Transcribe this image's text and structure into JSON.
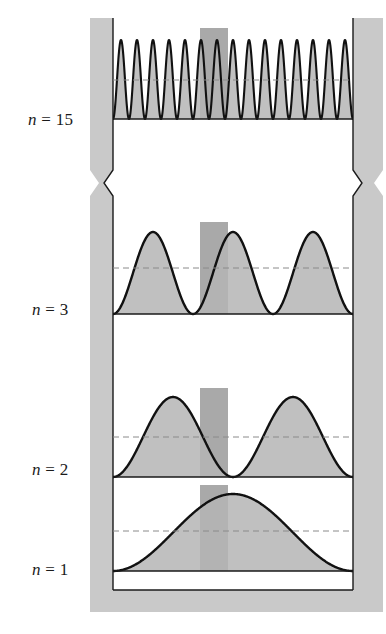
{
  "figure": {
    "wall_color": "#c9c9c9",
    "wall_line_color": "#1a1a1a",
    "curve_color": "#111111",
    "fill_color": "#b5b5b5",
    "band_color": "#9a9a9a",
    "dashed_color": "#8a8a8a",
    "break_symbol": "zigzag-break"
  },
  "well": {
    "left_wall_x": 90,
    "left_inner_x": 113,
    "right_inner_x": 353,
    "right_wall_x": 383,
    "highlight_band": {
      "label": "probability interval dx",
      "x_start": 200,
      "x_end": 228
    }
  },
  "panels": [
    {
      "id": "n15",
      "label_n": "n",
      "label_eq": "=",
      "label_value": "15",
      "quantum_number": 15,
      "peaks": 15,
      "baseline_y": 119,
      "peak_y": 40,
      "average_line_y": 80,
      "panel_top_y": 18,
      "panel_bottom_y": 170
    },
    {
      "id": "n3",
      "label_n": "n",
      "label_eq": "=",
      "label_value": "3",
      "quantum_number": 3,
      "peaks": 3,
      "baseline_y": 314,
      "peak_y": 232,
      "average_line_y": 268,
      "panel_top_y": 200,
      "panel_bottom_y": 314
    },
    {
      "id": "n2",
      "label_n": "n",
      "label_eq": "=",
      "label_value": "2",
      "quantum_number": 2,
      "peaks": 2,
      "baseline_y": 477,
      "peak_y": 397,
      "average_line_y": 437,
      "panel_top_y": 380,
      "panel_bottom_y": 477
    },
    {
      "id": "n1",
      "label_n": "n",
      "label_eq": "=",
      "label_value": "1",
      "quantum_number": 1,
      "peaks": 1,
      "baseline_y": 571,
      "peak_y": 494,
      "average_line_y": 531,
      "panel_top_y": 477,
      "panel_bottom_y": 590
    }
  ],
  "chart_data": {
    "type": "line",
    "xlabel": "x",
    "ylabel": "|psi|^2",
    "xlim": [
      0,
      1
    ],
    "ylim": [
      0,
      2
    ],
    "grid": false,
    "legend_position": "left-margin",
    "annotations": [
      "n = 15",
      "n = 3",
      "n = 2",
      "n = 1"
    ],
    "series": [
      {
        "name": "n = 1",
        "function": "2 sin^2(pi x)",
        "nodes_interior": 0,
        "maxima": 1,
        "maxima_x": [
          0.5
        ],
        "maxima_y": [
          2.0
        ],
        "average_y": 1.0,
        "x": [
          0,
          0.05,
          0.1,
          0.15,
          0.2,
          0.25,
          0.3,
          0.35,
          0.4,
          0.45,
          0.5,
          0.55,
          0.6,
          0.65,
          0.7,
          0.75,
          0.8,
          0.85,
          0.9,
          0.95,
          1
        ],
        "y": [
          0,
          0.049,
          0.191,
          0.412,
          0.691,
          1.0,
          1.309,
          1.588,
          1.809,
          1.951,
          2.0,
          1.951,
          1.809,
          1.588,
          1.309,
          1.0,
          0.691,
          0.412,
          0.191,
          0.049,
          0
        ]
      },
      {
        "name": "n = 2",
        "function": "2 sin^2(2 pi x)",
        "nodes_interior": 1,
        "maxima": 2,
        "maxima_x": [
          0.25,
          0.75
        ],
        "maxima_y": [
          2.0,
          2.0
        ],
        "average_y": 1.0,
        "x": [
          0,
          0.05,
          0.1,
          0.15,
          0.2,
          0.25,
          0.3,
          0.35,
          0.4,
          0.45,
          0.5,
          0.55,
          0.6,
          0.65,
          0.7,
          0.75,
          0.8,
          0.85,
          0.9,
          0.95,
          1
        ],
        "y": [
          0,
          0.191,
          0.691,
          1.309,
          1.809,
          2.0,
          1.809,
          1.309,
          0.691,
          0.191,
          0,
          0.191,
          0.691,
          1.309,
          1.809,
          2.0,
          1.809,
          1.309,
          0.691,
          0.191,
          0
        ]
      },
      {
        "name": "n = 3",
        "function": "2 sin^2(3 pi x)",
        "nodes_interior": 2,
        "maxima": 3,
        "maxima_x": [
          0.1667,
          0.5,
          0.8333
        ],
        "maxima_y": [
          2.0,
          2.0,
          2.0
        ],
        "average_y": 1.0,
        "x": [
          0,
          0.05,
          0.1,
          0.15,
          0.2,
          0.25,
          0.3,
          0.35,
          0.4,
          0.45,
          0.5,
          0.55,
          0.6,
          0.65,
          0.7,
          0.75,
          0.8,
          0.85,
          0.9,
          0.95,
          1
        ],
        "y": [
          0,
          0.412,
          1.309,
          1.951,
          1.809,
          1.0,
          0.191,
          0.049,
          0.691,
          1.588,
          2.0,
          1.588,
          0.691,
          0.049,
          0.191,
          1.0,
          1.809,
          1.951,
          1.309,
          0.412,
          0
        ]
      },
      {
        "name": "n = 15",
        "function": "2 sin^2(15 pi x)",
        "nodes_interior": 14,
        "maxima": 15,
        "maxima_y": [
          2.0
        ],
        "average_y": 1.0
      }
    ]
  }
}
